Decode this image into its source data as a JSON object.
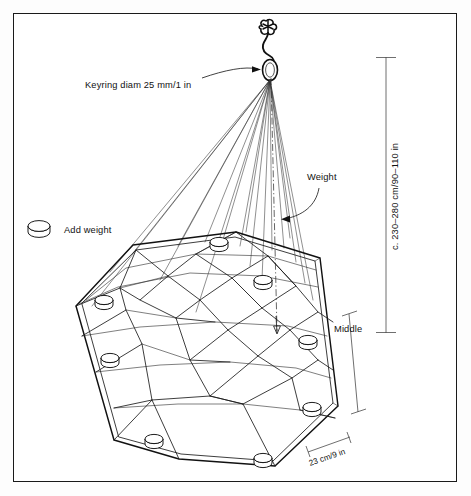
{
  "diagram": {
    "background_color": "#ffffff",
    "line_color": "#111111",
    "border_color": "#1a1a1a",
    "labels": {
      "keyring": "Keyring diam 25 mm/1 in",
      "add_weight": "Add weight",
      "weight": "Weight",
      "middle": "Middle",
      "height_dimension": "c. 230–280 cm/90–110 in",
      "width_dimension": "23 cm/9 in"
    },
    "icons": {
      "keyring_ring": "ring-icon",
      "hook": "hook-icon",
      "weight_disc": "weight-disc-icon",
      "arrow": "arrow-icon"
    },
    "measurements": {
      "keyring_diameter_mm": 25,
      "keyring_diameter_in": 1,
      "height_min_cm": 230,
      "height_max_cm": 280,
      "height_min_in": 90,
      "height_max_in": 110,
      "mesh_spacing_cm": 23,
      "mesh_spacing_in": 9,
      "weight_count": 8
    }
  }
}
